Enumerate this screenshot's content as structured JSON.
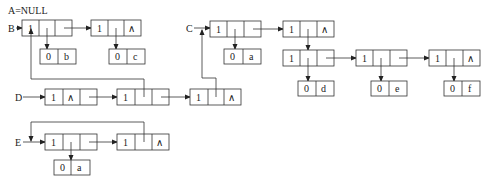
{
  "diagram": {
    "title_label": "A=NULL",
    "lists": {
      "B": {
        "label": "B"
      },
      "C": {
        "label": "C"
      },
      "D": {
        "label": "D"
      },
      "E": {
        "label": "E"
      }
    },
    "null_symbol": "∧",
    "nodes": [
      {
        "id": "B1",
        "tag": "1",
        "x": 22,
        "y": 20,
        "type": "list"
      },
      {
        "id": "B2",
        "tag": "1",
        "x": 91,
        "y": 20,
        "type": "list",
        "tail_null": true
      },
      {
        "id": "Bb",
        "tag": "0",
        "atom": "b",
        "x": 54,
        "y": 49
      },
      {
        "id": "Bc",
        "tag": "0",
        "atom": "c",
        "x": 127,
        "y": 49
      },
      {
        "id": "C1",
        "tag": "1",
        "x": 198,
        "y": 20,
        "type": "list"
      },
      {
        "id": "C2",
        "tag": "1",
        "x": 272,
        "y": 20,
        "type": "list",
        "tail_null": true
      },
      {
        "id": "Ca",
        "tag": "0",
        "atom": "a",
        "x": 224,
        "y": 49
      },
      {
        "id": "S1",
        "tag": "1",
        "x": 272,
        "y": 78,
        "type": "list"
      },
      {
        "id": "S2",
        "tag": "1",
        "x": 346,
        "y": 78,
        "type": "list"
      },
      {
        "id": "S3",
        "tag": "1",
        "x": 419,
        "y": 78,
        "type": "list",
        "tail_null": true
      },
      {
        "id": "Sd",
        "tag": "0",
        "atom": "d",
        "x": 298,
        "y": 104
      },
      {
        "id": "Se",
        "tag": "0",
        "atom": "e",
        "x": 371,
        "y": 104
      },
      {
        "id": "Sf",
        "tag": "0",
        "atom": "f",
        "x": 444,
        "y": 104
      },
      {
        "id": "D1",
        "tag": "1",
        "x": 45,
        "y": 89,
        "type": "list",
        "head_null": true
      },
      {
        "id": "D2",
        "tag": "1",
        "x": 117,
        "y": 89,
        "type": "list"
      },
      {
        "id": "D3",
        "tag": "1",
        "x": 190,
        "y": 89,
        "type": "list",
        "tail_null": true
      },
      {
        "id": "E1",
        "tag": "1",
        "x": 45,
        "y": 134,
        "type": "list"
      },
      {
        "id": "E2",
        "tag": "1",
        "x": 117,
        "y": 134,
        "type": "list",
        "tail_null": true
      },
      {
        "id": "Ea",
        "tag": "0",
        "atom": "a",
        "x": 54,
        "y": 157
      }
    ],
    "labels": {
      "B1_tag": "1",
      "B2_tag": "1",
      "b_tag": "0",
      "b_atom": "b",
      "c_tag": "0",
      "c_atom": "c",
      "C1_tag": "1",
      "C2_tag": "1",
      "Ca_tag": "0",
      "Ca_atom": "a",
      "S1_tag": "1",
      "S2_tag": "1",
      "S3_tag": "1",
      "d_tag": "0",
      "d_atom": "d",
      "e_tag": "0",
      "e_atom": "e",
      "f_tag": "0",
      "f_atom": "f",
      "D1_tag": "1",
      "D2_tag": "1",
      "D3_tag": "1",
      "E1_tag": "1",
      "E2_tag": "1",
      "Ea_tag": "0",
      "Ea_atom": "a"
    }
  }
}
